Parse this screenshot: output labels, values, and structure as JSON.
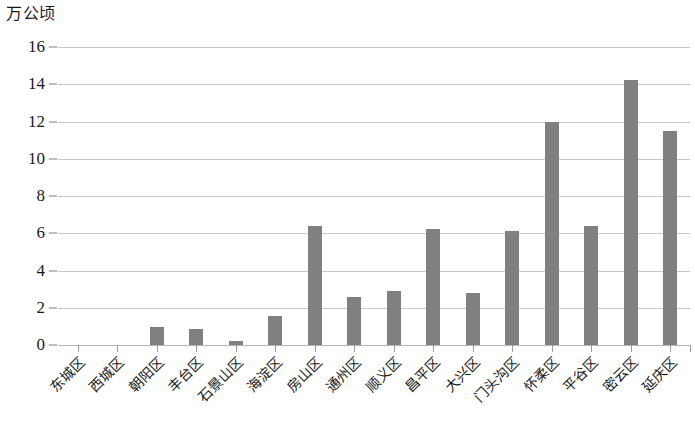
{
  "chart_data": {
    "type": "bar",
    "title": "",
    "subtitle": "",
    "xlabel": "",
    "ylabel": "万公顷",
    "ylim": [
      0,
      16
    ],
    "ytick_step": 2,
    "yticks": [
      "16",
      "14",
      "12",
      "10",
      "8",
      "6",
      "4",
      "2",
      "0"
    ],
    "grid": true,
    "legend": false,
    "legend_position": "none",
    "bar_color": "#808080",
    "gridline_color": "#c9c9c9",
    "categories": [
      "东城区",
      "西城区",
      "朝阳区",
      "丰台区",
      "石景山区",
      "海淀区",
      "房山区",
      "通州区",
      "顺义区",
      "昌平区",
      "大兴区",
      "门头沟区",
      "怀柔区",
      "平谷区",
      "密云区",
      "延庆区"
    ],
    "values": [
      0,
      0,
      0.95,
      0.85,
      0.2,
      1.55,
      6.4,
      2.6,
      2.9,
      6.25,
      2.8,
      6.1,
      12.0,
      6.4,
      14.25,
      11.5
    ]
  }
}
